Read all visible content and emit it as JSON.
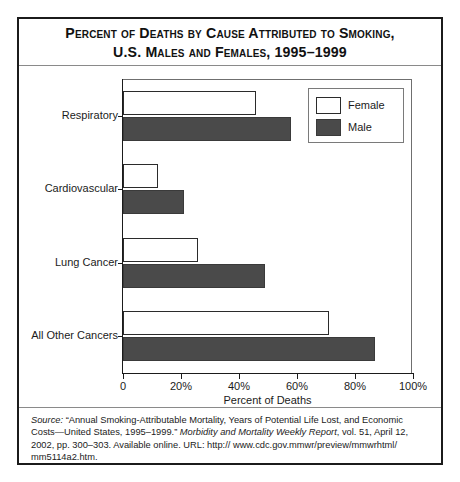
{
  "figure": {
    "title_line1": "Percent of Deaths by Cause Attributed to Smoking,",
    "title_line2": "U.S. Males and Females, 1995–1999"
  },
  "legend": {
    "position": "top-right",
    "entries": [
      {
        "label": "Female",
        "color": "#ffffff",
        "swatch": "female-swatch"
      },
      {
        "label": "Male",
        "color": "#4a4a4a",
        "swatch": "male-swatch"
      }
    ]
  },
  "axis": {
    "xlabel": "Percent of Deaths",
    "xticks": [
      "0",
      "20%",
      "40%",
      "60%",
      "80%",
      "100%"
    ],
    "xtick_values": [
      0,
      20,
      40,
      60,
      80,
      100
    ]
  },
  "source": {
    "label": "Source:",
    "line1": " “Annual Smoking-Attributable Mortality, Years of Potential Life Lost, and Economic Costs—United States, 1995–1999.” ",
    "journal": "Morbidity and Mortality Weekly Report",
    "line2": ", vol. 51, April 12, 2002, pp. 300–303. Available online. URL: http:// www.cdc.gov.mmwr/preview/mmwrhtml/ mm5114a2.htm."
  },
  "chart_data": {
    "type": "bar",
    "orientation": "horizontal",
    "title": "Percent of Deaths by Cause Attributed to Smoking, U.S. Males and Females, 1995–1999",
    "xlabel": "Percent of Deaths",
    "ylabel": "",
    "xlim": [
      0,
      100
    ],
    "grid": false,
    "legend_position": "top-right",
    "categories": [
      "Respiratory",
      "Cardiovascular",
      "Lung Cancer",
      "All Other Cancers"
    ],
    "series": [
      {
        "name": "Female",
        "color": "#ffffff",
        "values": [
          46,
          12,
          26,
          71
        ]
      },
      {
        "name": "Male",
        "color": "#4a4a4a",
        "values": [
          58,
          21,
          49,
          87
        ]
      }
    ]
  }
}
